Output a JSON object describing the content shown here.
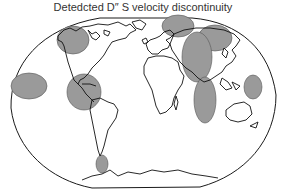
{
  "title": "Detedcted D″ S velocity discontinuity",
  "map": {
    "projection": "world-oval",
    "outline_color": "#1a1a1a",
    "coast_color": "#111111",
    "region_fill": "#9a9a9a",
    "region_stroke": "#555555",
    "regions": [
      {
        "name": "alaska-region",
        "cx": 73,
        "cy": 40,
        "rx": 16,
        "ry": 14
      },
      {
        "name": "central-pacific-region",
        "cx": 29,
        "cy": 86,
        "rx": 18,
        "ry": 13
      },
      {
        "name": "caribbean-region",
        "cx": 84,
        "cy": 92,
        "rx": 17,
        "ry": 18
      },
      {
        "name": "arctic-region",
        "cx": 178,
        "cy": 26,
        "rx": 16,
        "ry": 11
      },
      {
        "name": "siberia-region",
        "cx": 215,
        "cy": 38,
        "rx": 17,
        "ry": 13
      },
      {
        "name": "central-asia-region",
        "cx": 197,
        "cy": 57,
        "rx": 15,
        "ry": 25
      },
      {
        "name": "western-pacific-region",
        "cx": 253,
        "cy": 87,
        "rx": 9,
        "ry": 12
      },
      {
        "name": "indian-ocean-region",
        "cx": 205,
        "cy": 100,
        "rx": 11,
        "ry": 23
      },
      {
        "name": "south-america-tip-region",
        "cx": 102,
        "cy": 164,
        "rx": 6,
        "ry": 9
      }
    ]
  }
}
